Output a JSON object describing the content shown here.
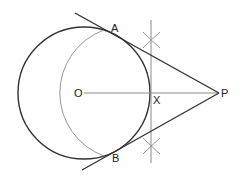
{
  "diagram": {
    "labels": {
      "A": "A",
      "B": "B",
      "O": "O",
      "X": "X",
      "P": "P"
    },
    "points": {
      "O": [
        84,
        93
      ],
      "P": [
        219,
        93
      ],
      "X": [
        151,
        93
      ],
      "A": [
        116,
        35
      ],
      "B": [
        116,
        151
      ]
    },
    "circle": {
      "center": "O",
      "radius": 66
    },
    "construction_arc": {
      "center": "X",
      "radius": 67
    },
    "colors": {
      "main_stroke": "#333333",
      "construction_stroke": "#8a8a8a",
      "label": "#222222"
    }
  }
}
